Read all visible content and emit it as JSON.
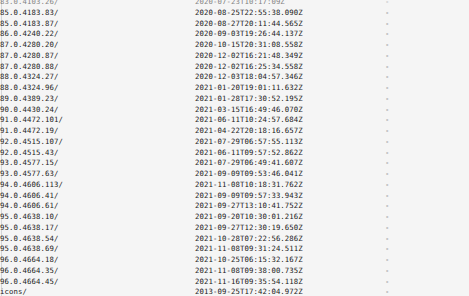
{
  "page": {
    "kind": "directory-listing",
    "background_color": "#f5f5f5",
    "text_color": "#222222",
    "focus_bar_color": "#c9c9c9",
    "size_placeholder": "-"
  },
  "columns": {
    "name": "Name",
    "date": "Last modified",
    "size": "Size"
  },
  "rows": [
    {
      "name": "83.0.4103.26/",
      "date": "2020-07-23T10:17:09Z",
      "size": "-",
      "clipped": true,
      "focused": false
    },
    {
      "name": "85.0.4183.83/",
      "date": "2020-08-25T22:55:38.090Z",
      "size": "-",
      "clipped": false,
      "focused": false
    },
    {
      "name": "85.0.4183.87/",
      "date": "2020-08-27T20:11:44.565Z",
      "size": "-",
      "clipped": false,
      "focused": false
    },
    {
      "name": "86.0.4240.22/",
      "date": "2020-09-03T19:26:44.137Z",
      "size": "-",
      "clipped": false,
      "focused": false
    },
    {
      "name": "87.0.4280.20/",
      "date": "2020-10-15T20:31:08.558Z",
      "size": "-",
      "clipped": false,
      "focused": false
    },
    {
      "name": "87.0.4280.87/",
      "date": "2020-12-02T16:21:48.349Z",
      "size": "-",
      "clipped": false,
      "focused": false
    },
    {
      "name": "87.0.4280.88/",
      "date": "2020-12-02T16:25:34.558Z",
      "size": "-",
      "clipped": false,
      "focused": false
    },
    {
      "name": "88.0.4324.27/",
      "date": "2020-12-03T18:04:57.346Z",
      "size": "-",
      "clipped": false,
      "focused": false
    },
    {
      "name": "88.0.4324.96/",
      "date": "2021-01-20T19:01:11.632Z",
      "size": "-",
      "clipped": false,
      "focused": false
    },
    {
      "name": "89.0.4389.23/",
      "date": "2021-01-28T17:30:52.195Z",
      "size": "-",
      "clipped": false,
      "focused": false
    },
    {
      "name": "90.0.4430.24/",
      "date": "2021-03-15T16:49:46.070Z",
      "size": "-",
      "clipped": false,
      "focused": false
    },
    {
      "name": "91.0.4472.101/",
      "date": "2021-06-11T10:24:57.684Z",
      "size": "-",
      "clipped": false,
      "focused": false
    },
    {
      "name": "91.0.4472.19/",
      "date": "2021-04-22T20:18:16.657Z",
      "size": "-",
      "clipped": false,
      "focused": false
    },
    {
      "name": "92.0.4515.107/",
      "date": "2021-07-29T06:57:55.113Z",
      "size": "-",
      "clipped": false,
      "focused": false
    },
    {
      "name": "92.0.4515.43/",
      "date": "2021-06-11T09:57:52.862Z",
      "size": "-",
      "clipped": false,
      "focused": false
    },
    {
      "name": "93.0.4577.15/",
      "date": "2021-07-29T06:49:41.607Z",
      "size": "-",
      "clipped": false,
      "focused": false
    },
    {
      "name": "93.0.4577.63/",
      "date": "2021-09-09T09:53:46.041Z",
      "size": "-",
      "clipped": false,
      "focused": false
    },
    {
      "name": "94.0.4606.113/",
      "date": "2021-11-08T10:18:31.762Z",
      "size": "-",
      "clipped": false,
      "focused": false
    },
    {
      "name": "94.0.4606.41/",
      "date": "2021-09-09T09:57:33.943Z",
      "size": "-",
      "clipped": false,
      "focused": false
    },
    {
      "name": "94.0.4606.61/",
      "date": "2021-09-27T13:10:41.752Z",
      "size": "-",
      "clipped": false,
      "focused": false
    },
    {
      "name": "95.0.4638.10/",
      "date": "2021-09-20T10:30:01.216Z",
      "size": "-",
      "clipped": false,
      "focused": false
    },
    {
      "name": "95.0.4638.17/",
      "date": "2021-09-27T12:30:19.650Z",
      "size": "-",
      "clipped": false,
      "focused": false
    },
    {
      "name": "95.0.4638.54/",
      "date": "2021-10-28T07:22:56.286Z",
      "size": "-",
      "clipped": false,
      "focused": false
    },
    {
      "name": "95.0.4638.69/",
      "date": "2021-11-08T09:31:24.511Z",
      "size": "-",
      "clipped": false,
      "focused": false
    },
    {
      "name": "96.0.4664.18/",
      "date": "2021-10-25T06:15:32.167Z",
      "size": "-",
      "clipped": false,
      "focused": false
    },
    {
      "name": "96.0.4664.35/",
      "date": "2021-11-08T09:38:00.735Z",
      "size": "-",
      "clipped": false,
      "focused": false
    },
    {
      "name": "96.0.4664.45/",
      "date": "2021-11-16T09:35:54.118Z",
      "size": "-",
      "clipped": false,
      "focused": false
    },
    {
      "name": "icons/",
      "date": "2013-09-25T17:42:04.972Z",
      "size": "-",
      "clipped": false,
      "focused": true
    }
  ]
}
